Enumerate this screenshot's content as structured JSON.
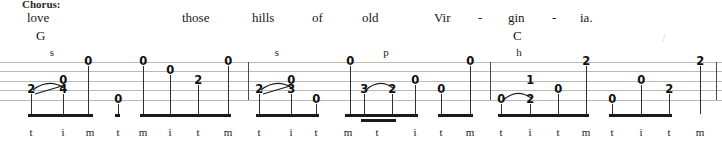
{
  "section": {
    "label": "Chorus:"
  },
  "lyrics": [
    {
      "text": "love",
      "x": 27
    },
    {
      "text": "those",
      "x": 182
    },
    {
      "text": "hills",
      "x": 252
    },
    {
      "text": "of",
      "x": 312
    },
    {
      "text": "old",
      "x": 362
    },
    {
      "text": "Vir",
      "x": 434
    },
    {
      "text": "-",
      "x": 478
    },
    {
      "text": "gin",
      "x": 508
    },
    {
      "text": "-",
      "x": 552
    },
    {
      "text": "ia.",
      "x": 580
    }
  ],
  "chords": [
    {
      "name": "G",
      "x": 36
    },
    {
      "name": "C",
      "x": 513
    }
  ],
  "slash_mark": {
    "glyph": "/",
    "x": 662
  },
  "staff": {
    "string_count": 5,
    "line_color": "#b9b9b9",
    "barlines_x": [
      248,
      490,
      716
    ]
  },
  "techniques": [
    {
      "symbol": "s",
      "x": 52,
      "name": "slide"
    },
    {
      "symbol": "s",
      "x": 277,
      "name": "slide"
    },
    {
      "symbol": "p",
      "x": 386,
      "name": "pull-off"
    },
    {
      "symbol": "h",
      "x": 519,
      "name": "hammer-on"
    }
  ],
  "notes": [
    {
      "fret": "2",
      "x": 31,
      "string": 4
    },
    {
      "fret": "4",
      "x": 63,
      "string": 4
    },
    {
      "fret": "0",
      "x": 63,
      "string": 3
    },
    {
      "fret": "0",
      "x": 88,
      "string": 1
    },
    {
      "fret": "0",
      "x": 118,
      "string": 5
    },
    {
      "fret": "0",
      "x": 143,
      "string": 1
    },
    {
      "fret": "0",
      "x": 170,
      "string": 2
    },
    {
      "fret": "2",
      "x": 198,
      "string": 3
    },
    {
      "fret": "0",
      "x": 228,
      "string": 1
    },
    {
      "fret": "2",
      "x": 259,
      "string": 4
    },
    {
      "fret": "3",
      "x": 291,
      "string": 4
    },
    {
      "fret": "0",
      "x": 291,
      "string": 3
    },
    {
      "fret": "0",
      "x": 316,
      "string": 5
    },
    {
      "fret": "0",
      "x": 350,
      "string": 1
    },
    {
      "fret": "3",
      "x": 364,
      "string": 4
    },
    {
      "fret": "2",
      "x": 392,
      "string": 4
    },
    {
      "fret": "0",
      "x": 415,
      "string": 3
    },
    {
      "fret": "0",
      "x": 441,
      "string": 4
    },
    {
      "fret": "0",
      "x": 470,
      "string": 1
    },
    {
      "fret": "0",
      "x": 501,
      "string": 5
    },
    {
      "fret": "2",
      "x": 530,
      "string": 5
    },
    {
      "fret": "1",
      "x": 530,
      "string": 3
    },
    {
      "fret": "0",
      "x": 558,
      "string": 4
    },
    {
      "fret": "2",
      "x": 586,
      "string": 1
    },
    {
      "fret": "0",
      "x": 612,
      "string": 5
    },
    {
      "fret": "0",
      "x": 641,
      "string": 3
    },
    {
      "fret": "2",
      "x": 669,
      "string": 4
    },
    {
      "fret": "2",
      "x": 700,
      "string": 1
    }
  ],
  "slurs": [
    {
      "x1": 33,
      "x2": 64,
      "string": 4,
      "type": "slide"
    },
    {
      "x1": 261,
      "x2": 292,
      "string": 4,
      "type": "slide"
    },
    {
      "x1": 366,
      "x2": 393,
      "string": 4,
      "type": "pull-off"
    },
    {
      "x1": 503,
      "x2": 531,
      "string": 5,
      "type": "hammer-on"
    }
  ],
  "fingering": [
    {
      "letter": "t",
      "x": 31
    },
    {
      "letter": "i",
      "x": 63
    },
    {
      "letter": "m",
      "x": 90
    },
    {
      "letter": "t",
      "x": 118
    },
    {
      "letter": "m",
      "x": 143
    },
    {
      "letter": "i",
      "x": 170
    },
    {
      "letter": "t",
      "x": 198
    },
    {
      "letter": "m",
      "x": 228
    },
    {
      "letter": "t",
      "x": 259
    },
    {
      "letter": "i",
      "x": 291
    },
    {
      "letter": "t",
      "x": 316
    },
    {
      "letter": "m",
      "x": 348
    },
    {
      "letter": "t",
      "x": 377
    },
    {
      "letter": "i",
      "x": 415
    },
    {
      "letter": "t",
      "x": 441
    },
    {
      "letter": "m",
      "x": 470
    },
    {
      "letter": "t",
      "x": 501
    },
    {
      "letter": "i",
      "x": 530
    },
    {
      "letter": "t",
      "x": 558
    },
    {
      "letter": "m",
      "x": 586
    },
    {
      "letter": "t",
      "x": 612
    },
    {
      "letter": "i",
      "x": 641
    },
    {
      "letter": "t",
      "x": 669
    },
    {
      "letter": "m",
      "x": 700
    }
  ],
  "beams": [
    {
      "x1": 28,
      "x2": 93,
      "level": 1
    },
    {
      "x1": 115,
      "x2": 120,
      "level": 1
    },
    {
      "x1": 140,
      "x2": 231,
      "level": 1
    },
    {
      "x1": 256,
      "x2": 319,
      "level": 1
    },
    {
      "x1": 345,
      "x2": 418,
      "level": 1
    },
    {
      "x1": 361,
      "x2": 396,
      "level": 2
    },
    {
      "x1": 438,
      "x2": 473,
      "level": 1
    },
    {
      "x1": 498,
      "x2": 589,
      "level": 1
    },
    {
      "x1": 609,
      "x2": 672,
      "level": 1
    }
  ]
}
